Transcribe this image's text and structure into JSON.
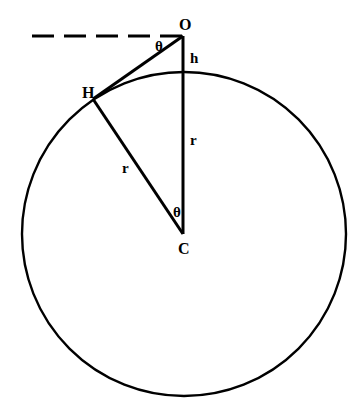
{
  "diagram": {
    "colors": {
      "stroke": "#000000",
      "background": "#ffffff"
    },
    "points": {
      "O": {
        "label": "O",
        "x": 183,
        "y": 36
      },
      "H": {
        "label": "H",
        "x": 93,
        "y": 99
      },
      "C": {
        "label": "C",
        "x": 183,
        "y": 234
      }
    },
    "circle": {
      "cx": 184,
      "cy": 234,
      "r": 162
    },
    "labels": {
      "observer": "O",
      "horizon": "H",
      "center": "C",
      "height": "h",
      "radius_vertical": "r",
      "radius_slanted": "r",
      "angle_at_observer": "θ",
      "angle_at_center": "θ"
    }
  }
}
